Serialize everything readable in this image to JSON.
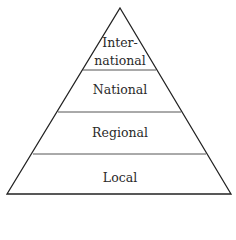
{
  "diagram": {
    "type": "pyramid",
    "levels": [
      {
        "label_line1": "Inter-",
        "label_line2": "national"
      },
      {
        "label": "National"
      },
      {
        "label": "Regional"
      },
      {
        "label": "Local"
      }
    ]
  }
}
